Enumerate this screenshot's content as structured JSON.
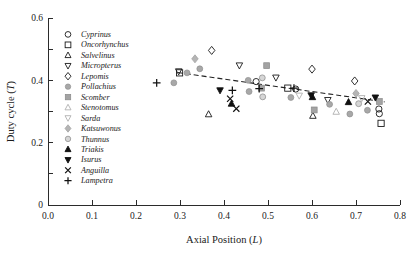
{
  "chart_data": {
    "type": "scatter",
    "title": "",
    "xlabel": "Axial Position (L)",
    "xlabel_main": "Axial Position (",
    "xlabel_italic": "L",
    "xlabel_tail": ")",
    "ylabel": "Duty cycle (T)",
    "ylabel_main": "Duty cycle (",
    "ylabel_italic": "T",
    "ylabel_tail": ")",
    "xlim": [
      0.0,
      0.8
    ],
    "ylim": [
      0.0,
      0.6
    ],
    "xticks": [
      0.0,
      0.1,
      0.2,
      0.3,
      0.4,
      0.5,
      0.6,
      0.7,
      0.8
    ],
    "xticklabels": [
      "0.0",
      "0.1",
      "0.2",
      "0.3",
      "0.4",
      "0.5",
      "0.6",
      "0.7",
      "0.8"
    ],
    "yticks": [
      0.0,
      0.1,
      0.2,
      0.3,
      0.4,
      0.5,
      0.6
    ],
    "yticklabels": [
      "0",
      "",
      "0.2",
      "",
      "0.4",
      "",
      "0.6"
    ],
    "grid": false,
    "legend_position": "upper-left-inside",
    "trendline": {
      "type": "dashed-linear",
      "x_start": 0.295,
      "y_start": 0.425,
      "x_end": 0.765,
      "y_end": 0.331,
      "style": "dashed"
    },
    "series": [
      {
        "name": "Cyprinus",
        "marker": "circle-open",
        "color": "#1a1a1a",
        "fill": "none",
        "points": [
          {
            "x": 0.473,
            "y": 0.396
          },
          {
            "x": 0.563,
            "y": 0.372
          },
          {
            "x": 0.752,
            "y": 0.308
          },
          {
            "x": 0.753,
            "y": 0.293
          }
        ]
      },
      {
        "name": "Oncorhynchus",
        "marker": "square-open",
        "color": "#1a1a1a",
        "fill": "none",
        "points": [
          {
            "x": 0.299,
            "y": 0.424
          },
          {
            "x": 0.545,
            "y": 0.375
          },
          {
            "x": 0.757,
            "y": 0.262
          }
        ]
      },
      {
        "name": "Salvelinus",
        "marker": "triangle-up-open",
        "color": "#1a1a1a",
        "fill": "none",
        "points": [
          {
            "x": 0.365,
            "y": 0.291
          },
          {
            "x": 0.602,
            "y": 0.286
          }
        ]
      },
      {
        "name": "Micropterus",
        "marker": "triangle-down-open",
        "color": "#1a1a1a",
        "fill": "none",
        "points": [
          {
            "x": 0.297,
            "y": 0.429
          },
          {
            "x": 0.435,
            "y": 0.448
          },
          {
            "x": 0.518,
            "y": 0.409
          },
          {
            "x": 0.636,
            "y": 0.337
          }
        ]
      },
      {
        "name": "Lepomis",
        "marker": "diamond-open",
        "color": "#1a1a1a",
        "fill": "none",
        "points": [
          {
            "x": 0.372,
            "y": 0.496
          },
          {
            "x": 0.6,
            "y": 0.436
          },
          {
            "x": 0.697,
            "y": 0.398
          }
        ]
      },
      {
        "name": "Pollachius",
        "marker": "circle-filled-gray",
        "color": "#a8a8a8",
        "fill": "#a8a8a8",
        "points": [
          {
            "x": 0.316,
            "y": 0.424
          },
          {
            "x": 0.345,
            "y": 0.437
          },
          {
            "x": 0.286,
            "y": 0.392
          },
          {
            "x": 0.455,
            "y": 0.4
          },
          {
            "x": 0.457,
            "y": 0.364
          },
          {
            "x": 0.552,
            "y": 0.345
          },
          {
            "x": 0.64,
            "y": 0.323
          },
          {
            "x": 0.686,
            "y": 0.292
          },
          {
            "x": 0.726,
            "y": 0.304
          }
        ]
      },
      {
        "name": "Scomber",
        "marker": "square-filled-gray",
        "color": "#a3a3a3",
        "fill": "#a3a3a3",
        "points": [
          {
            "x": 0.497,
            "y": 0.447
          },
          {
            "x": 0.485,
            "y": 0.375
          },
          {
            "x": 0.605,
            "y": 0.305
          },
          {
            "x": 0.753,
            "y": 0.332
          }
        ]
      },
      {
        "name": "Stenotomus",
        "marker": "triangle-up-gray",
        "color": "#bdbdbd",
        "fill": "#bdbdbd",
        "points": [
          {
            "x": 0.655,
            "y": 0.299
          }
        ]
      },
      {
        "name": "Sarda",
        "marker": "triangle-down-gray",
        "color": "#bdbdbd",
        "fill": "#bdbdbd",
        "points": [
          {
            "x": 0.571,
            "y": 0.351
          },
          {
            "x": 0.713,
            "y": 0.343
          }
        ]
      },
      {
        "name": "Katsuwonus",
        "marker": "diamond-gray",
        "color": "#b5b5b5",
        "fill": "#b5b5b5",
        "points": [
          {
            "x": 0.334,
            "y": 0.469
          },
          {
            "x": 0.7,
            "y": 0.358
          }
        ]
      },
      {
        "name": "Thunnus",
        "marker": "circle-gray-ring",
        "color": "#b0b0b0",
        "fill": "#d6d6d6",
        "points": [
          {
            "x": 0.487,
            "y": 0.408
          },
          {
            "x": 0.488,
            "y": 0.347
          },
          {
            "x": 0.706,
            "y": 0.325
          }
        ]
      },
      {
        "name": "Triakis",
        "marker": "triangle-up-filled",
        "color": "#111111",
        "fill": "#111111",
        "points": [
          {
            "x": 0.417,
            "y": 0.325
          },
          {
            "x": 0.601,
            "y": 0.346
          },
          {
            "x": 0.683,
            "y": 0.33
          }
        ]
      },
      {
        "name": "Isurus",
        "marker": "triangle-down-filled",
        "color": "#111111",
        "fill": "#111111",
        "points": [
          {
            "x": 0.391,
            "y": 0.368
          },
          {
            "x": 0.598,
            "y": 0.352
          },
          {
            "x": 0.744,
            "y": 0.345
          }
        ]
      },
      {
        "name": "Anguilla",
        "marker": "cross-x",
        "color": "#111111",
        "fill": "#111111",
        "points": [
          {
            "x": 0.414,
            "y": 0.341
          },
          {
            "x": 0.428,
            "y": 0.309
          },
          {
            "x": 0.727,
            "y": 0.332
          }
        ]
      },
      {
        "name": "Lampetra",
        "marker": "plus",
        "color": "#111111",
        "fill": "#111111",
        "points": [
          {
            "x": 0.247,
            "y": 0.392
          },
          {
            "x": 0.419,
            "y": 0.368
          },
          {
            "x": 0.48,
            "y": 0.373
          },
          {
            "x": 0.559,
            "y": 0.375
          }
        ]
      }
    ],
    "legend_entries": [
      {
        "label": "Cyprinus",
        "marker": "circle-open"
      },
      {
        "label": "Oncorhynchus",
        "marker": "square-open"
      },
      {
        "label": "Salvelinus",
        "marker": "triangle-up-open"
      },
      {
        "label": "Micropterus",
        "marker": "triangle-down-open"
      },
      {
        "label": "Lepomis",
        "marker": "diamond-open"
      },
      {
        "label": "Pollachius",
        "marker": "circle-filled-gray"
      },
      {
        "label": "Scomber",
        "marker": "square-filled-gray"
      },
      {
        "label": "Stenotomus",
        "marker": "triangle-up-gray"
      },
      {
        "label": "Sarda",
        "marker": "triangle-down-gray"
      },
      {
        "label": "Katsuwonus",
        "marker": "diamond-gray"
      },
      {
        "label": "Thunnus",
        "marker": "circle-gray-ring"
      },
      {
        "label": "Triakis",
        "marker": "triangle-up-filled"
      },
      {
        "label": "Isurus",
        "marker": "triangle-down-filled"
      },
      {
        "label": "Anguilla",
        "marker": "cross-x"
      },
      {
        "label": "Lampetra",
        "marker": "plus"
      }
    ]
  }
}
